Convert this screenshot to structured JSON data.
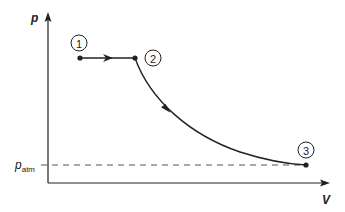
{
  "diagram": {
    "axes": {
      "y_label": "p",
      "x_label": "V",
      "p_atm_label_main": "p",
      "p_atm_label_sub": "atm"
    },
    "points": [
      {
        "id": "1",
        "label": "1",
        "x": 80,
        "y": 58
      },
      {
        "id": "2",
        "label": "2",
        "x": 135,
        "y": 58
      },
      {
        "id": "3",
        "label": "3",
        "x": 306,
        "y": 165
      }
    ],
    "processes": [
      {
        "from": "1",
        "to": "2",
        "type": "isobaric (horizontal)"
      },
      {
        "from": "2",
        "to": "3",
        "type": "expansion curve"
      }
    ],
    "reference_line": {
      "label": "p_atm",
      "style": "dashed"
    },
    "colors": {
      "line": "#222222",
      "dashed": "#555555",
      "background": "#ffffff"
    }
  }
}
